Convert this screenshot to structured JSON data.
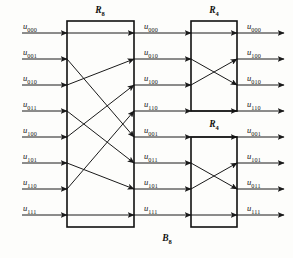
{
  "figure": {
    "name": "B8 permutation network",
    "background_color": "#fdfdfb",
    "line_color": "#1a1a1a",
    "text_color": "#141414"
  },
  "blocks": {
    "r8": {
      "label": "R",
      "subscript": "8"
    },
    "r4_top": {
      "label": "R",
      "subscript": "4"
    },
    "r4_bottom": {
      "label": "R",
      "subscript": "4"
    },
    "network": {
      "label": "B",
      "subscript": "8"
    }
  },
  "stage_inputs": [
    {
      "base": "u",
      "sub": "000"
    },
    {
      "base": "u",
      "sub": "001"
    },
    {
      "base": "u",
      "sub": "010"
    },
    {
      "base": "u",
      "sub": "011"
    },
    {
      "base": "u",
      "sub": "100"
    },
    {
      "base": "u",
      "sub": "101"
    },
    {
      "base": "u",
      "sub": "110"
    },
    {
      "base": "u",
      "sub": "111"
    }
  ],
  "stage_middle": [
    {
      "base": "u",
      "sub": "000"
    },
    {
      "base": "u",
      "sub": "010"
    },
    {
      "base": "u",
      "sub": "100"
    },
    {
      "base": "u",
      "sub": "110"
    },
    {
      "base": "u",
      "sub": "001"
    },
    {
      "base": "u",
      "sub": "011"
    },
    {
      "base": "u",
      "sub": "101"
    },
    {
      "base": "u",
      "sub": "111"
    }
  ],
  "stage_outputs": [
    {
      "base": "u",
      "sub": "000"
    },
    {
      "base": "u",
      "sub": "100"
    },
    {
      "base": "u",
      "sub": "010"
    },
    {
      "base": "u",
      "sub": "110"
    },
    {
      "base": "u",
      "sub": "001"
    },
    {
      "base": "u",
      "sub": "101"
    },
    {
      "base": "u",
      "sub": "011"
    },
    {
      "base": "u",
      "sub": "111"
    }
  ],
  "chart_data": {
    "type": "diagram",
    "title": "B8",
    "rows": 8,
    "row_y": [
      33,
      59,
      85,
      111,
      137,
      163,
      189,
      215
    ],
    "r8_box": {
      "x": 67,
      "y": 21,
      "width": 67,
      "height": 206
    },
    "r4_top_box": {
      "x": 191,
      "y": 21,
      "width": 46,
      "height": 90
    },
    "r4_bottom_box": {
      "x": 191,
      "y": 137,
      "width": 46,
      "height": 90
    },
    "r8_permutation": [
      0,
      4,
      1,
      5,
      2,
      6,
      3,
      7
    ],
    "r4_top_permutation": [
      0,
      2,
      1,
      3
    ],
    "r4_bottom_permutation": [
      0,
      2,
      1,
      3
    ]
  }
}
